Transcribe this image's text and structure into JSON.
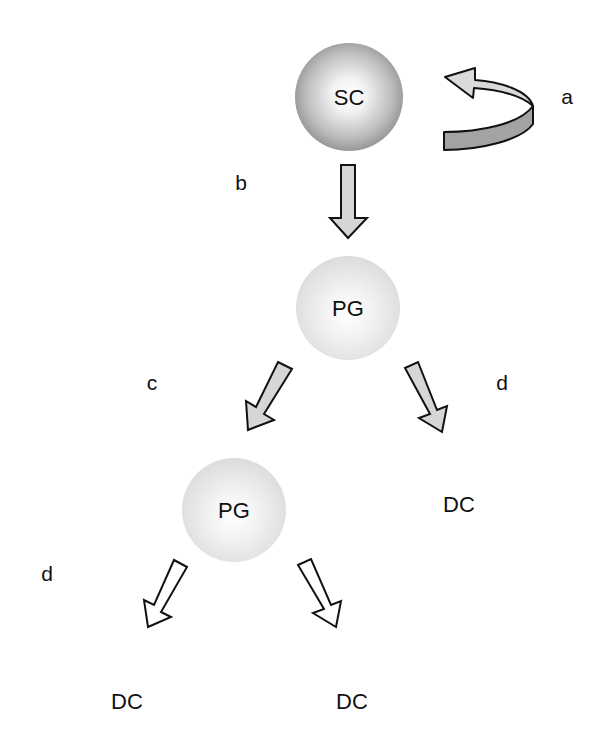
{
  "nodes": {
    "sc": {
      "label": "SC"
    },
    "pg_top": {
      "label": "PG"
    },
    "pg_bottom": {
      "label": "PG"
    },
    "dc_right": {
      "label": "DC"
    },
    "dc_bottom_left": {
      "label": "DC"
    },
    "dc_bottom_right": {
      "label": "DC"
    }
  },
  "steps": {
    "a": "a",
    "b": "b",
    "c": "c",
    "d_right": "d",
    "d_left": "d"
  },
  "colors": {
    "arrow_fill": "#d6d6d6",
    "arrow_hollow_fill": "#ffffff",
    "arrow_stroke": "#111111",
    "ribbon_top": "#dadada",
    "ribbon_side": "#a3a3a3"
  }
}
